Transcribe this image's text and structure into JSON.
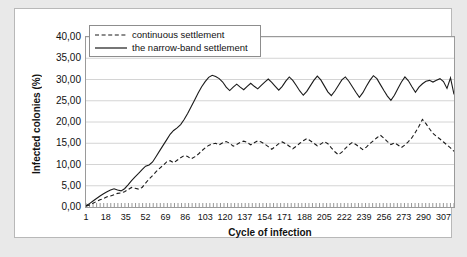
{
  "chart_data": {
    "type": "line",
    "title": "",
    "xlabel": "Cycle of infection",
    "ylabel": "Infected colonies (%)",
    "xlim": [
      1,
      316
    ],
    "ylim": [
      0,
      40
    ],
    "grid": true,
    "legend_position": "top-left-inside",
    "y_tick_labels": [
      "0,00",
      "5,00",
      "10,00",
      "15,00",
      "20,00",
      "25,00",
      "30,00",
      "35,00",
      "40,00"
    ],
    "y_tick_values": [
      0,
      5,
      10,
      15,
      20,
      25,
      30,
      35,
      40
    ],
    "x_tick_labels": [
      "1",
      "18",
      "35",
      "52",
      "69",
      "86",
      "103",
      "120",
      "137",
      "154",
      "171",
      "188",
      "205",
      "222",
      "239",
      "256",
      "273",
      "290",
      "307"
    ],
    "x_tick_values": [
      1,
      18,
      35,
      52,
      69,
      86,
      103,
      120,
      137,
      154,
      171,
      188,
      205,
      222,
      239,
      256,
      273,
      290,
      307
    ],
    "series": [
      {
        "name": "continuous settlement",
        "style": "dashed",
        "color": "#1a1a1a",
        "x": [
          1,
          4,
          7,
          10,
          13,
          16,
          19,
          22,
          25,
          28,
          31,
          34,
          37,
          40,
          43,
          46,
          49,
          52,
          55,
          58,
          61,
          64,
          67,
          70,
          73,
          76,
          79,
          82,
          85,
          88,
          91,
          94,
          97,
          100,
          103,
          106,
          109,
          112,
          115,
          118,
          121,
          124,
          127,
          130,
          133,
          136,
          139,
          142,
          145,
          148,
          151,
          154,
          157,
          160,
          163,
          166,
          169,
          172,
          175,
          178,
          181,
          184,
          187,
          190,
          193,
          196,
          199,
          202,
          205,
          208,
          211,
          214,
          217,
          220,
          223,
          226,
          229,
          232,
          235,
          238,
          241,
          244,
          247,
          250,
          253,
          256,
          259,
          262,
          265,
          268,
          271,
          274,
          277,
          280,
          283,
          286,
          289,
          292,
          295,
          298,
          301,
          304,
          307,
          310,
          313,
          316
        ],
        "values": [
          0.2,
          0.5,
          0.9,
          1.3,
          1.7,
          2.0,
          2.4,
          2.6,
          2.9,
          3.2,
          3.3,
          3.6,
          4.1,
          4.6,
          4.4,
          4.2,
          4.6,
          5.6,
          6.6,
          7.4,
          8.3,
          9.1,
          9.8,
          10.6,
          10.9,
          10.4,
          11.0,
          11.6,
          12.1,
          11.9,
          11.3,
          11.8,
          12.4,
          13.2,
          13.9,
          14.5,
          14.8,
          15.0,
          14.6,
          15.1,
          15.4,
          15.0,
          14.3,
          14.7,
          15.2,
          15.5,
          15.2,
          14.6,
          15.1,
          15.6,
          15.3,
          14.8,
          14.2,
          13.6,
          14.2,
          14.9,
          15.3,
          14.9,
          14.3,
          13.7,
          14.3,
          15.0,
          15.6,
          16.1,
          15.6,
          15.0,
          14.4,
          14.8,
          15.4,
          14.9,
          13.9,
          13.0,
          12.3,
          12.9,
          13.8,
          14.6,
          15.2,
          14.7,
          14.1,
          13.5,
          14.1,
          14.9,
          15.6,
          16.3,
          16.9,
          16.2,
          15.4,
          14.7,
          15.1,
          14.6,
          14.0,
          14.6,
          15.4,
          16.3,
          17.6,
          19.0,
          20.6,
          19.6,
          18.4,
          17.3,
          16.6,
          16.0,
          15.3,
          14.6,
          13.9,
          13.1
        ]
      },
      {
        "name": "the narrow-band settlement",
        "style": "solid",
        "color": "#1a1a1a",
        "x": [
          1,
          4,
          7,
          10,
          13,
          16,
          19,
          22,
          25,
          28,
          31,
          34,
          37,
          40,
          43,
          46,
          49,
          52,
          55,
          58,
          61,
          64,
          67,
          70,
          73,
          76,
          79,
          82,
          85,
          88,
          91,
          94,
          97,
          100,
          103,
          106,
          109,
          112,
          115,
          118,
          121,
          124,
          127,
          130,
          133,
          136,
          139,
          142,
          145,
          148,
          151,
          154,
          157,
          160,
          163,
          166,
          169,
          172,
          175,
          178,
          181,
          184,
          187,
          190,
          193,
          196,
          199,
          202,
          205,
          208,
          211,
          214,
          217,
          220,
          223,
          226,
          229,
          232,
          235,
          238,
          241,
          244,
          247,
          250,
          253,
          256,
          259,
          262,
          265,
          268,
          271,
          274,
          277,
          280,
          283,
          286,
          289,
          292,
          295,
          298,
          301,
          304,
          307,
          310,
          313,
          316
        ],
        "values": [
          0.3,
          0.8,
          1.4,
          2.0,
          2.6,
          3.1,
          3.6,
          4.0,
          4.3,
          4.0,
          3.8,
          4.3,
          5.2,
          6.2,
          7.1,
          7.9,
          8.8,
          9.6,
          9.9,
          10.6,
          11.9,
          13.2,
          14.5,
          15.8,
          17.1,
          18.0,
          18.6,
          19.4,
          20.6,
          22.0,
          23.6,
          25.2,
          26.8,
          28.3,
          29.5,
          30.5,
          31.0,
          30.7,
          30.2,
          29.4,
          28.2,
          27.4,
          28.2,
          28.9,
          28.2,
          27.6,
          28.4,
          29.1,
          28.4,
          27.8,
          28.6,
          29.4,
          30.1,
          29.3,
          28.4,
          27.5,
          28.4,
          29.6,
          30.6,
          29.8,
          28.6,
          27.3,
          26.3,
          27.2,
          28.5,
          29.8,
          30.8,
          29.9,
          28.5,
          27.1,
          26.2,
          27.3,
          28.6,
          29.9,
          30.6,
          29.6,
          28.3,
          27.0,
          25.8,
          26.9,
          28.4,
          29.8,
          30.9,
          30.2,
          28.8,
          27.4,
          26.1,
          25.1,
          26.3,
          27.9,
          29.4,
          30.6,
          29.7,
          28.3,
          27.0,
          28.2,
          29.0,
          29.6,
          29.8,
          29.4,
          29.8,
          30.2,
          29.5,
          27.9,
          30.4,
          26.5
        ]
      }
    ]
  },
  "legend": {
    "items": [
      {
        "label": "continuous settlement",
        "style": "dashed"
      },
      {
        "label": "the narrow-band settlement",
        "style": "solid"
      }
    ]
  }
}
